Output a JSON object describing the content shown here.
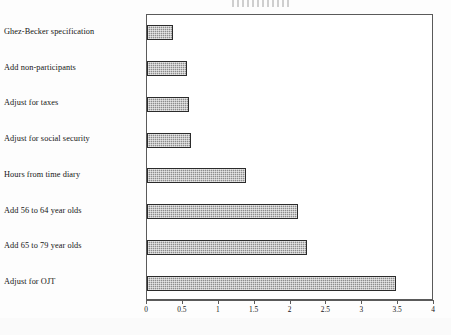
{
  "figure": {
    "title_remnant": "",
    "background_color": "#ffffff",
    "frame_color": "#5a5a5a",
    "bar_fill_color": "#8d8d8d",
    "bar_border_color": "#2b2b2b"
  },
  "chart_data": {
    "type": "bar",
    "orientation": "horizontal",
    "title": "",
    "xlabel": "",
    "ylabel": "",
    "xlim": [
      0,
      4
    ],
    "grid": false,
    "legend": false,
    "categories": [
      "Ghez-Becker specification",
      "Add non-participants",
      "Adjust for taxes",
      "Adjust for social security",
      "Hours from time diary",
      "Add 56 to 64 year olds",
      "Add 65 to 79 year olds",
      "Adjust for OJT"
    ],
    "values": [
      0.36,
      0.56,
      0.58,
      0.61,
      1.38,
      2.1,
      2.23,
      3.47
    ],
    "xticks": [
      0,
      0.5,
      1,
      1.5,
      2,
      2.5,
      3,
      3.5,
      4
    ],
    "xticklabels": [
      "0",
      "0.5",
      "1",
      "1.5",
      "2",
      "2.5",
      "3",
      "3.5",
      "4"
    ]
  }
}
